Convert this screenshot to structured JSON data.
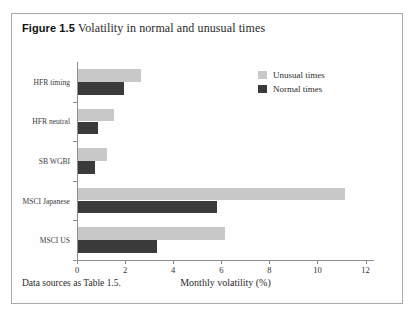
{
  "figure": {
    "number_label": "Figure 1.5",
    "caption": "Volatility in normal and unusual times",
    "source_note": "Data sources as Table 1.5."
  },
  "legend": {
    "position": "top-right",
    "entries": [
      {
        "label": "Unusual times",
        "color": "#c8c8c8"
      },
      {
        "label": "Normal times",
        "color": "#3a3a3a"
      }
    ]
  },
  "chart_data": {
    "type": "bar",
    "orientation": "horizontal",
    "title": "Volatility in normal and unusual times",
    "xlabel": "Monthly volatility (%)",
    "ylabel": "",
    "xlim": [
      0,
      12.35
    ],
    "xticks": [
      0,
      2,
      4,
      6,
      8,
      10,
      12
    ],
    "xtick_labels": [
      "0",
      "2",
      "4",
      "6",
      "8",
      "10",
      "12"
    ],
    "grid": false,
    "categories": [
      "HFR timing",
      "HFR neutral",
      "SB WGBI",
      "MSCI Japanese",
      "MSCI US"
    ],
    "series": [
      {
        "name": "Unusual times",
        "color": "#c8c8c8",
        "values": [
          2.6,
          1.5,
          1.2,
          11.1,
          6.1
        ]
      },
      {
        "name": "Normal times",
        "color": "#3a3a3a",
        "values": [
          1.9,
          0.85,
          0.7,
          5.8,
          3.3
        ]
      }
    ]
  }
}
